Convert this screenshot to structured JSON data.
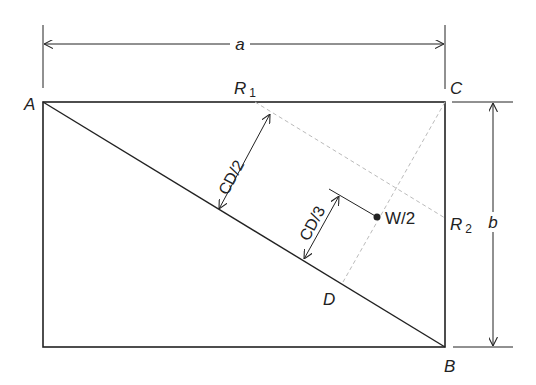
{
  "diagram": {
    "title": "",
    "colors": {
      "line": "#222222",
      "dashed": "#bbbbbb",
      "background": "#ffffff"
    },
    "points": {
      "A": {
        "label": "A"
      },
      "B": {
        "label": "B"
      },
      "C": {
        "label": "C"
      },
      "D": {
        "label": "D"
      },
      "R1": {
        "label": "R",
        "sub": "1"
      },
      "R2": {
        "label": "R",
        "sub": "2"
      }
    },
    "dimensions": {
      "width": {
        "label": "a"
      },
      "height": {
        "label": "b"
      },
      "half": {
        "label": "CD/2"
      },
      "third": {
        "label": "CD/3"
      }
    },
    "load": {
      "label": "W/2"
    }
  }
}
